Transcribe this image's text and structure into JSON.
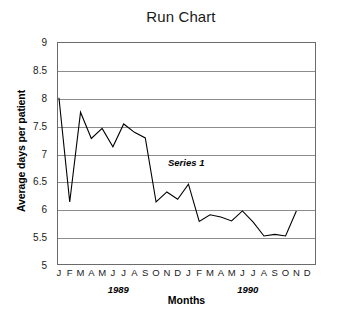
{
  "chart_data": {
    "type": "line",
    "title": "Run Chart",
    "xlabel": "Months",
    "ylabel": "Average days per patient",
    "ylim": [
      5,
      9
    ],
    "yticks": [
      "5",
      "5.5",
      "6",
      "6.5",
      "7",
      "7.5",
      "8",
      "8.5",
      "9"
    ],
    "ytick_values": [
      5,
      5.5,
      6,
      6.5,
      7,
      7.5,
      8,
      8.5,
      9
    ],
    "grid": true,
    "legend": "none",
    "annotations": [
      {
        "text": "Series 1",
        "x": "1989-10",
        "y": 6.8
      }
    ],
    "group_labels": [
      {
        "label": "1989",
        "start_index": 0,
        "end_index": 11
      },
      {
        "label": "1990",
        "start_index": 12,
        "end_index": 23
      }
    ],
    "categories": [
      "J",
      "F",
      "M",
      "A",
      "M",
      "J",
      "J",
      "A",
      "S",
      "O",
      "N",
      "D",
      "J",
      "F",
      "M",
      "A",
      "M",
      "J",
      "J",
      "A",
      "S",
      "O",
      "N",
      "D"
    ],
    "series": [
      {
        "name": "Series 1",
        "color": "#000000",
        "values": [
          8.0,
          6.13,
          7.74,
          7.27,
          7.45,
          7.12,
          7.53,
          7.38,
          7.28,
          6.13,
          6.31,
          6.18,
          6.45,
          5.78,
          5.9,
          5.86,
          5.79,
          5.97,
          5.77,
          5.52,
          5.55,
          5.52,
          5.97,
          null
        ]
      }
    ]
  },
  "style": {
    "line_color": "#000000",
    "grid_color": "#8c8c8c",
    "frame_color": "#6b6b6b",
    "text_color": "#1a1a1a",
    "background": "#ffffff"
  }
}
